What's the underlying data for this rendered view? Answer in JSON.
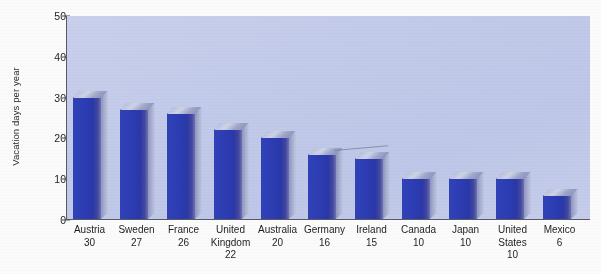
{
  "chart_data": {
    "type": "bar",
    "title": "",
    "xlabel": "",
    "ylabel": "Vacation days per year",
    "ylim": [
      0,
      50
    ],
    "yticks": [
      0,
      10,
      20,
      30,
      40,
      50
    ],
    "grid": false,
    "legend": null,
    "categories": [
      "Austria",
      "Sweden",
      "France",
      "United Kingdom",
      "Australia",
      "Germany",
      "Ireland",
      "Canada",
      "Japan",
      "United States",
      "Mexico"
    ],
    "values": [
      30,
      27,
      26,
      22,
      20,
      16,
      15,
      10,
      10,
      10,
      6
    ],
    "bars": [
      {
        "category": "Austria",
        "value": 30,
        "label_lines": [
          "Austria",
          "30"
        ]
      },
      {
        "category": "Sweden",
        "value": 27,
        "label_lines": [
          "Sweden",
          "27"
        ]
      },
      {
        "category": "France",
        "value": 26,
        "label_lines": [
          "France",
          "26"
        ]
      },
      {
        "category": "United Kingdom",
        "value": 22,
        "label_lines": [
          "United",
          "Kingdom",
          "22"
        ]
      },
      {
        "category": "Australia",
        "value": 20,
        "label_lines": [
          "Australia",
          "20"
        ]
      },
      {
        "category": "Germany",
        "value": 16,
        "label_lines": [
          "Germany",
          "16"
        ]
      },
      {
        "category": "Ireland",
        "value": 15,
        "label_lines": [
          "Ireland",
          "15"
        ]
      },
      {
        "category": "Canada",
        "value": 10,
        "label_lines": [
          "Canada",
          "10"
        ]
      },
      {
        "category": "Japan",
        "value": 10,
        "label_lines": [
          "Japan",
          "10"
        ]
      },
      {
        "category": "United States",
        "value": 10,
        "label_lines": [
          "United",
          "States",
          "10"
        ]
      },
      {
        "category": "Mexico",
        "value": 6,
        "label_lines": [
          "Mexico",
          "6"
        ]
      }
    ],
    "colors": {
      "bar_front": "#2c3cb2",
      "bar_top": "#b9c0dd",
      "bar_side": "#a6adcf",
      "plot_background": "#c4ccea",
      "page_background": "#fbfbfb",
      "axis_line": "#565b66",
      "text": "#1e1e1e"
    }
  },
  "axis": {
    "y_title": "Vacation days per year",
    "y_tick_labels": [
      "50",
      "40",
      "30",
      "20",
      "10",
      "0"
    ]
  }
}
